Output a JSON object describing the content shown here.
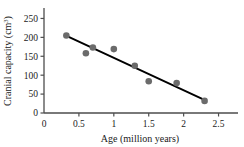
{
  "chart_data": {
    "type": "scatter",
    "title": "",
    "xlabel": "Age (million years)",
    "ylabel": "Cranial capacity (cm³)",
    "ylabel_main": "Cranial capacity (cm",
    "ylabel_sup": "3",
    "ylabel_close": ")",
    "xlim": [
      0,
      2.75
    ],
    "ylim": [
      0,
      275
    ],
    "xticks": [
      0,
      0.5,
      1,
      1.5,
      2,
      2.5
    ],
    "xtick_labels": [
      "0",
      "0.5",
      "1",
      "1.5",
      "2",
      "2.5"
    ],
    "yticks": [
      0,
      50,
      100,
      150,
      200,
      250
    ],
    "ytick_labels": [
      "0",
      "50",
      "100",
      "150",
      "200",
      "250"
    ],
    "grid": false,
    "legend": null,
    "marker_color": "#6b6b6b",
    "line_color": "#000000",
    "axis_color": "#4d4d4d",
    "points": [
      {
        "x": 0.32,
        "y": 205
      },
      {
        "x": 0.6,
        "y": 158
      },
      {
        "x": 0.7,
        "y": 173
      },
      {
        "x": 1.0,
        "y": 169
      },
      {
        "x": 1.3,
        "y": 125
      },
      {
        "x": 1.5,
        "y": 84
      },
      {
        "x": 1.9,
        "y": 79
      },
      {
        "x": 2.3,
        "y": 32
      }
    ],
    "trend_line": {
      "x": [
        0.33,
        2.32
      ],
      "y": [
        203,
        33
      ],
      "description": "fitted regression line, negative slope"
    }
  }
}
